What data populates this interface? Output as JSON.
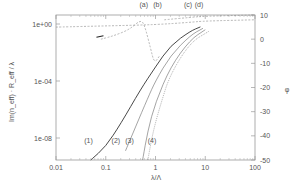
{
  "chart_data": {
    "type": "line",
    "title": "",
    "xlabel": "λ/Λ",
    "ylabel_left": "Im(n_eff) · R_eff / λ",
    "ylabel_right": "φ",
    "xscale": "log",
    "xlim": [
      0.01,
      100
    ],
    "ylim_left_log": [
      1e-10,
      10
    ],
    "ylim_right": [
      -50,
      10
    ],
    "x_ticks": [
      "0.01",
      "0.1",
      "1",
      "10",
      "100"
    ],
    "y_left_ticks": [
      "1e+00",
      "1e-04",
      "1e-08"
    ],
    "y_right_ticks": [
      "10",
      "0",
      "-10",
      "-20",
      "-30",
      "-40",
      "-50"
    ],
    "grid": false,
    "curve_labels": [
      "(1)",
      "(2)",
      "(3)",
      "(4)",
      "(a)",
      "(b)",
      "(c)",
      "(d)"
    ],
    "note": "Curve coordinates below are approximate, traced by eye from a low-resolution image.",
    "series": [
      {
        "name": "(1)",
        "axis": "left",
        "style": "solid",
        "x": [
          0.05,
          0.1,
          0.2,
          0.5,
          1,
          2,
          5,
          8
        ],
        "y_log10": [
          -9.9,
          -8.6,
          -7.0,
          -4.6,
          -3.0,
          -1.5,
          -0.5,
          -0.2
        ]
      },
      {
        "name": "(2)",
        "axis": "left",
        "style": "solid-thin",
        "x": [
          0.25,
          0.4,
          0.7,
          1,
          2,
          5,
          9
        ],
        "y_log10": [
          -8.9,
          -7.2,
          -5.2,
          -4.0,
          -2.2,
          -0.8,
          -0.3
        ]
      },
      {
        "name": "(3)",
        "axis": "left",
        "style": "solid-thin",
        "x": [
          0.55,
          0.7,
          1,
          2,
          5,
          10
        ],
        "y_log10": [
          -9.9,
          -7.5,
          -5.5,
          -3.0,
          -1.1,
          -0.4
        ]
      },
      {
        "name": "(4)",
        "axis": "left",
        "style": "dotted",
        "x": [
          0.7,
          0.9,
          1.3,
          2,
          5,
          12
        ],
        "y_log10": [
          -9.9,
          -7.5,
          -5.5,
          -3.5,
          -1.3,
          -0.5
        ]
      },
      {
        "name": "phase-a",
        "axis": "right",
        "style": "dashed",
        "x": [
          0.08,
          0.15,
          0.3,
          0.5,
          0.6,
          0.8,
          0.95,
          1.2
        ],
        "y": [
          0,
          1.5,
          4,
          8,
          6,
          -4,
          -10,
          -7
        ]
      },
      {
        "name": "phase-b",
        "axis": "right",
        "style": "dashed",
        "x": [
          0.01,
          0.1,
          1,
          5,
          10,
          100
        ],
        "y": [
          5,
          5.5,
          6,
          7,
          7.5,
          8
        ]
      },
      {
        "name": "phase-c",
        "axis": "right",
        "style": "dashed",
        "x": [
          1.5,
          5,
          10,
          100
        ],
        "y": [
          8,
          9,
          9.5,
          10
        ]
      }
    ],
    "annotations": [
      {
        "text": "(a)",
        "x": 0.58,
        "y_px": 7
      },
      {
        "text": "(b)",
        "x": 1.1,
        "y_px": 7
      },
      {
        "text": "(c)",
        "x": 4.5,
        "y_px": 7
      },
      {
        "text": "(d)",
        "x": 7.5,
        "y_px": 7
      },
      {
        "text": "(1)",
        "x": 0.045,
        "y_px": 143
      },
      {
        "text": "(2)",
        "x": 0.16,
        "y_px": 143
      },
      {
        "text": "(3)",
        "x": 0.3,
        "y_px": 143
      },
      {
        "text": "(4)",
        "x": 0.85,
        "y_px": 143
      }
    ]
  }
}
